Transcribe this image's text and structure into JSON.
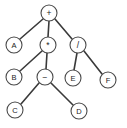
{
  "diagram": {
    "type": "binary-expression-tree",
    "canvas": {
      "width": 127,
      "height": 128,
      "background": "#ffffff"
    },
    "style": {
      "node_fill": "#ffffff",
      "node_stroke": "#4a4a4a",
      "edge_stroke": "#3a3a3a",
      "label_color": "#1c1c1c",
      "node_radius": 8
    },
    "nodes": [
      {
        "id": "n1",
        "label": "+",
        "kind": "operator",
        "cx": 49,
        "cy": 13,
        "r": 8
      },
      {
        "id": "n2",
        "label": "A",
        "kind": "operand",
        "cx": 14,
        "cy": 45,
        "r": 8
      },
      {
        "id": "n3",
        "label": "*",
        "kind": "operator",
        "cx": 48,
        "cy": 45,
        "r": 8
      },
      {
        "id": "n4",
        "label": "/",
        "kind": "operator",
        "cx": 78,
        "cy": 45,
        "r": 8
      },
      {
        "id": "n5",
        "label": "B",
        "kind": "operand",
        "cx": 14,
        "cy": 77,
        "r": 8
      },
      {
        "id": "n6",
        "label": "−",
        "kind": "operator",
        "cx": 45,
        "cy": 77,
        "r": 8
      },
      {
        "id": "n7",
        "label": "E",
        "kind": "operand",
        "cx": 73,
        "cy": 78,
        "r": 8
      },
      {
        "id": "n8",
        "label": "F",
        "kind": "operand",
        "cx": 108,
        "cy": 80,
        "r": 8
      },
      {
        "id": "n9",
        "label": "C",
        "kind": "operand",
        "cx": 15,
        "cy": 110,
        "r": 8
      },
      {
        "id": "n10",
        "label": "D",
        "kind": "operand",
        "cx": 79,
        "cy": 111,
        "r": 8
      }
    ],
    "edges": [
      {
        "from": "n1",
        "to": "n2",
        "x1": 43,
        "y1": 19,
        "x2": 20,
        "y2": 39
      },
      {
        "from": "n1",
        "to": "n3",
        "x1": 49,
        "y1": 21,
        "x2": 48,
        "y2": 37
      },
      {
        "from": "n1",
        "to": "n4",
        "x1": 55,
        "y1": 19,
        "x2": 72,
        "y2": 39
      },
      {
        "from": "n3",
        "to": "n5",
        "x1": 42,
        "y1": 51,
        "x2": 20,
        "y2": 71
      },
      {
        "from": "n3",
        "to": "n6",
        "x1": 47,
        "y1": 53,
        "x2": 46,
        "y2": 69
      },
      {
        "from": "n4",
        "to": "n7",
        "x1": 77,
        "y1": 53,
        "x2": 74,
        "y2": 70
      },
      {
        "from": "n4",
        "to": "n8",
        "x1": 84,
        "y1": 51,
        "x2": 102,
        "y2": 74
      },
      {
        "from": "n6",
        "to": "n9",
        "x1": 39,
        "y1": 83,
        "x2": 21,
        "y2": 104
      },
      {
        "from": "n6",
        "to": "n10",
        "x1": 51,
        "y1": 83,
        "x2": 73,
        "y2": 105
      }
    ]
  }
}
